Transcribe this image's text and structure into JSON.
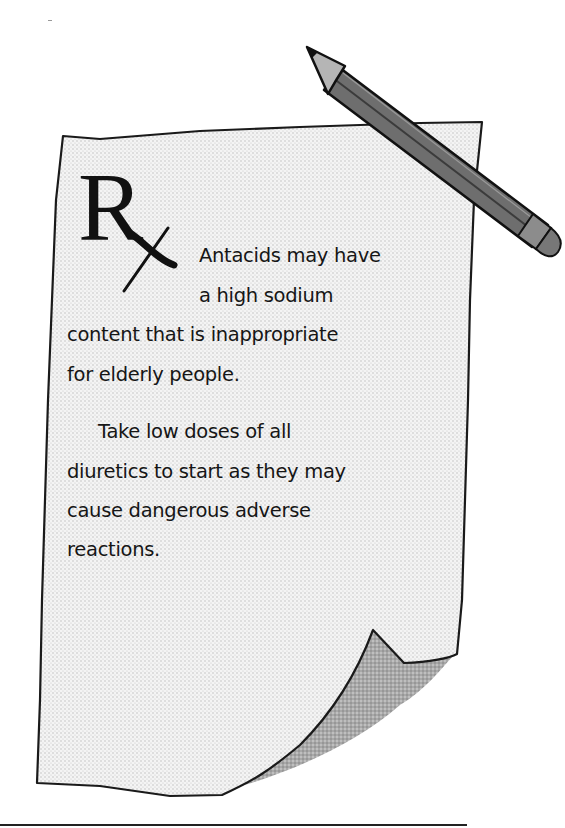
{
  "note": {
    "symbol": "R",
    "symbol_name": "prescription-rx-symbol",
    "paragraphs": [
      {
        "lines": [
          "Antacids may have",
          "a high sodium",
          "content that is inappropriate",
          "for elderly people."
        ]
      },
      {
        "lines": [
          "Take low doses of all",
          "diuretics to start as they may",
          "cause dangerous adverse",
          "reactions."
        ]
      }
    ]
  },
  "illustration": {
    "paper": "curled-paper-note",
    "pencil": "pencil-icon"
  },
  "colors": {
    "paper_fill": "#f1f1f1",
    "paper_outline": "#1a1a1a",
    "curl_shadow": "#9a9a9a",
    "pencil_body": "#6e6e6e",
    "pencil_tip": "#b5b5b5",
    "text": "#161616"
  }
}
